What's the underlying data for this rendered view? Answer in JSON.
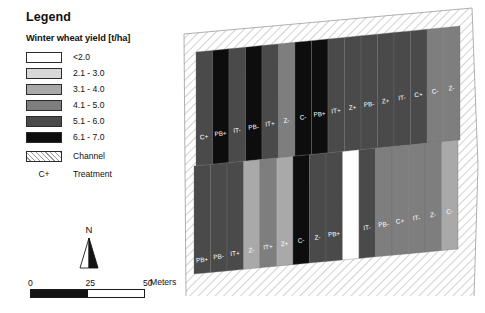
{
  "legend": {
    "title": "Legend",
    "subtitle": "Winter wheat yield [t/ha]",
    "classes": [
      {
        "label": "<2.0",
        "color": "#ffffff"
      },
      {
        "label": "2.1 - 3.0",
        "color": "#d8d8d8"
      },
      {
        "label": "3.1 - 4.0",
        "color": "#a9a9a9"
      },
      {
        "label": "4.1 - 5.0",
        "color": "#7e7e7e"
      },
      {
        "label": "5.1 - 6.0",
        "color": "#4a4a4a"
      },
      {
        "label": "6.1 - 7.0",
        "color": "#0d0d0d"
      }
    ],
    "channel_label": "Channel",
    "treatment_code": "C+",
    "treatment_label": "Treatment"
  },
  "north_arrow": {
    "label": "N"
  },
  "scalebar": {
    "ticks": [
      "0",
      "25",
      "50"
    ],
    "units": "Meters",
    "segments": [
      "#141414",
      "#ffffff"
    ]
  },
  "map": {
    "channel_label": "Channel",
    "top_row": [
      {
        "code": "C+",
        "class": 4
      },
      {
        "code": "PB+",
        "class": 5
      },
      {
        "code": "IT-",
        "class": 4
      },
      {
        "code": "PB-",
        "class": 5
      },
      {
        "code": "IT+",
        "class": 4
      },
      {
        "code": "Z-",
        "class": 3
      },
      {
        "code": "C-",
        "class": 5
      },
      {
        "code": "PB+",
        "class": 5
      },
      {
        "code": "IT+",
        "class": 4
      },
      {
        "code": "Z+",
        "class": 4
      },
      {
        "code": "PB-",
        "class": 4
      },
      {
        "code": "Z+",
        "class": 4
      },
      {
        "code": "IT-",
        "class": 4
      },
      {
        "code": "C+",
        "class": 4
      },
      {
        "code": "C-",
        "class": 3
      },
      {
        "code": "Z-",
        "class": 3
      }
    ],
    "bottom_row": [
      {
        "code": "PB+",
        "class": 4
      },
      {
        "code": "PB-",
        "class": 4
      },
      {
        "code": "IT+",
        "class": 4
      },
      {
        "code": "Z-",
        "class": 2
      },
      {
        "code": "IT+",
        "class": 3
      },
      {
        "code": "Z+",
        "class": 2
      },
      {
        "code": "C-",
        "class": 5
      },
      {
        "code": "Z-",
        "class": 4
      },
      {
        "code": "PB+",
        "class": 4
      },
      {
        "code": "C+",
        "class": 0
      },
      {
        "code": "IT-",
        "class": 4
      },
      {
        "code": "PB-",
        "class": 3
      },
      {
        "code": "C+",
        "class": 3
      },
      {
        "code": "IT-",
        "class": 3
      },
      {
        "code": "Z-",
        "class": 3
      },
      {
        "code": "C-",
        "class": 2
      }
    ]
  }
}
